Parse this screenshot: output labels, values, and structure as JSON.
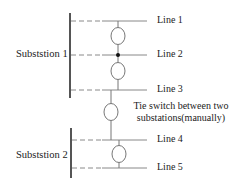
{
  "diagram": {
    "type": "single-line distribution network with tie switch",
    "colors": {
      "bus": "#555555",
      "line": "#888888",
      "dashed": "#8a8a8a",
      "switch": "#777777",
      "node": "#111111",
      "text": "#222222"
    },
    "substations": [
      {
        "id": "sub1",
        "label": "Subststion 1",
        "lines": [
          "Line 1",
          "Line 2",
          "Line 3"
        ]
      },
      {
        "id": "sub2",
        "label": "Subststion 2",
        "lines": [
          "Line 4",
          "Line 5"
        ]
      }
    ],
    "lines": [
      {
        "label": "Line 1"
      },
      {
        "label": "Line 2"
      },
      {
        "label": "Line 3"
      },
      {
        "label": "Line 4"
      },
      {
        "label": "Line 5"
      }
    ],
    "tie_switch": {
      "label_line1": "Tie switch between two",
      "label_line2": "substations(manually)"
    }
  }
}
